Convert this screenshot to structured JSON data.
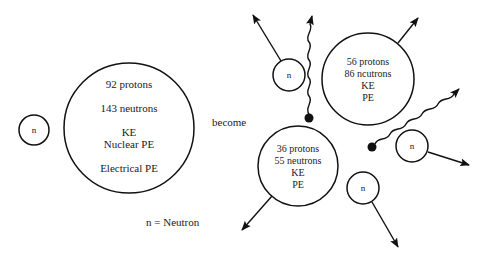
{
  "diagram": {
    "type": "nuclear-fission",
    "incoming_neutron": {
      "label": "n"
    },
    "parent_nucleus": {
      "lines": [
        "92 protons",
        "143 neutrons",
        "KE",
        "Nuclear PE",
        "Electrical PE"
      ]
    },
    "transition_label": "become",
    "legend": "n = Neutron",
    "product_nucleus_a": {
      "lines": [
        "56 protons",
        "86 ncutrons",
        "KE",
        "PE"
      ]
    },
    "product_nucleus_b": {
      "lines": [
        "36 protons",
        "55 neutrons",
        "KE",
        "PE"
      ]
    },
    "released_neutrons": [
      {
        "label": "n"
      },
      {
        "label": "n"
      },
      {
        "label": "n"
      }
    ],
    "gamma_rays": 2,
    "colors": {
      "stroke": "#111111",
      "background": "#ffffff"
    }
  }
}
